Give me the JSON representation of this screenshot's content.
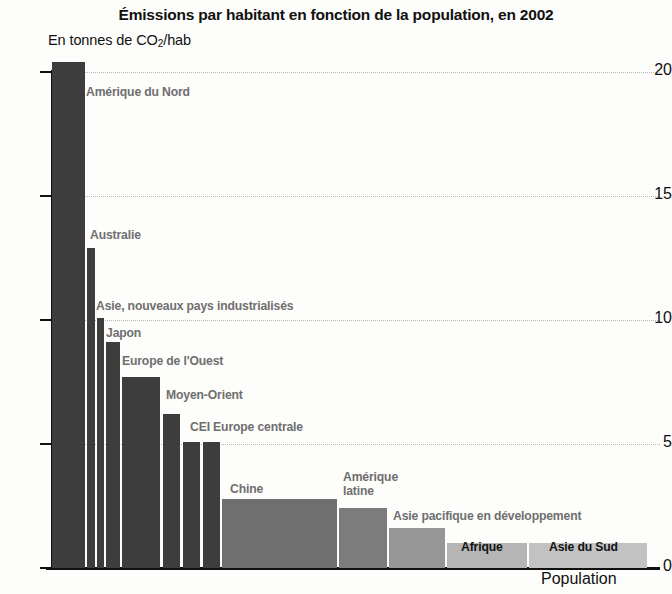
{
  "chart_data": {
    "type": "bar",
    "title": "Émissions par habitant en fonction de la population, en 2002",
    "subtitle_prefix": "En tonnes de CO",
    "subtitle_sub": "2",
    "subtitle_suffix": "/hab",
    "ylabel": "En tonnes de CO2/hab",
    "xlabel": "Population",
    "ylim": [
      0,
      21
    ],
    "yticks": [
      0,
      5,
      10,
      15,
      20
    ],
    "ytick_labels": [
      "0",
      "5",
      "10",
      "15",
      "20"
    ],
    "grid": "horizontal-dotted",
    "legend": "none",
    "note": "Bar widths are proportional to population; bar heights are per-capita CO2 emissions in tonnes.",
    "categories": [
      "Amérique du Nord",
      "Australie",
      "Asie, nouveaux pays industrialisés",
      "Japon",
      "Europe de l'Ouest",
      "Moyen-Orient",
      "CEI",
      "Europe centrale",
      "Chine",
      "Amérique latine",
      "Asie pacifique en développement",
      "Afrique",
      "Asie du Sud"
    ],
    "values": [
      20.4,
      12.9,
      10.1,
      9.1,
      7.7,
      6.2,
      5.1,
      5.1,
      2.8,
      2.4,
      1.6,
      1.0,
      1.0
    ],
    "bars": [
      {
        "label": "Amérique du Nord",
        "value": 20.4,
        "x": 52,
        "width": 33,
        "color": "#3d3d3d",
        "label_pos": "right-top",
        "label_x": 86,
        "label_y": 85
      },
      {
        "label": "Australie",
        "value": 12.9,
        "x": 87,
        "width": 8,
        "color": "#3d3d3d",
        "label_pos": "right-top",
        "label_x": 90,
        "label_y": 228
      },
      {
        "label": "Asie, nouveaux pays industrialisés",
        "value": 10.1,
        "x": 97,
        "width": 7,
        "color": "#3d3d3d",
        "label_pos": "right-top",
        "label_x": 96,
        "label_y": 299
      },
      {
        "label": "Japon",
        "value": 9.1,
        "x": 106,
        "width": 14,
        "color": "#3d3d3d",
        "label_pos": "right-top",
        "label_x": 106,
        "label_y": 326
      },
      {
        "label": "Europe de l'Ouest",
        "value": 7.7,
        "x": 122,
        "width": 38,
        "color": "#3d3d3d",
        "label_pos": "right-top",
        "label_x": 122,
        "label_y": 354
      },
      {
        "label": "Moyen-Orient",
        "value": 6.2,
        "x": 163,
        "width": 17,
        "color": "#3d3d3d",
        "label_pos": "right-top",
        "label_x": 166,
        "label_y": 388
      },
      {
        "label": "CEI Europe centrale",
        "value": 5.1,
        "x": 183,
        "width": 17,
        "color": "#3d3d3d",
        "label_pos": "right-top",
        "label_x": 190,
        "label_y": 420
      },
      {
        "label": "",
        "value": 5.1,
        "x": 203,
        "width": 17,
        "color": "#3d3d3d",
        "label_pos": "none",
        "label_x": 0,
        "label_y": 0
      },
      {
        "label": "Chine",
        "value": 2.8,
        "x": 222,
        "width": 115,
        "color": "#6f6f6f",
        "label_pos": "right-top",
        "label_x": 230,
        "label_y": 482
      },
      {
        "label": "Amérique latine",
        "value": 2.4,
        "x": 339,
        "width": 48,
        "color": "#7c7c7c",
        "label_pos": "above",
        "label_x": 343,
        "label_y": 470
      },
      {
        "label": "Asie pacifique en développement",
        "value": 1.6,
        "x": 389,
        "width": 56,
        "color": "#969696",
        "label_pos": "right-top",
        "label_x": 393,
        "label_y": 509
      },
      {
        "label": "Afrique",
        "value": 1.0,
        "x": 447,
        "width": 80,
        "color": "#b5b5b5",
        "label_pos": "inside",
        "label_x": 461,
        "label_y": 540
      },
      {
        "label": "Asie du Sud",
        "value": 1.0,
        "x": 529,
        "width": 118,
        "color": "#c2c2c2",
        "label_pos": "inside",
        "label_x": 549,
        "label_y": 540
      }
    ]
  }
}
